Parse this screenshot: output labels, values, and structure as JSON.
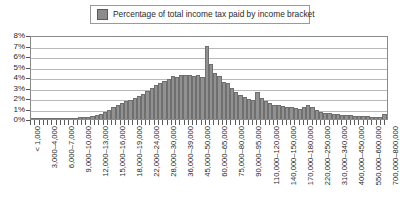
{
  "legend": {
    "label": "Percentage of total income tax paid by income bracket",
    "swatch_color": "#8c8c8c",
    "position": "top-center"
  },
  "chart_data": {
    "type": "bar",
    "title": "",
    "subtitle": "",
    "xlabel": "",
    "ylabel": "",
    "ylim": [
      0,
      8
    ],
    "ytick_labels": [
      "8%",
      "7%",
      "6%",
      "5%",
      "4%",
      "3%",
      "2%",
      "1%",
      "0%"
    ],
    "ytick_values": [
      8,
      7,
      6,
      5,
      4,
      3,
      2,
      1,
      0
    ],
    "grid": true,
    "bar_color": "#919191",
    "bar_edge_color": "#6f6f6f",
    "series": [
      {
        "name": "Percentage of total income tax paid by income bracket",
        "values": [
          0.05,
          0.05,
          0.05,
          0.06,
          0.07,
          0.08,
          0.09,
          0.1,
          0.1,
          0.12,
          0.13,
          0.15,
          0.17,
          0.2,
          0.25,
          0.35,
          0.5,
          0.7,
          0.9,
          1.1,
          1.3,
          1.5,
          1.7,
          1.85,
          2.0,
          2.2,
          2.4,
          2.7,
          3.0,
          3.2,
          3.4,
          3.6,
          3.8,
          4.1,
          4.0,
          4.2,
          4.15,
          4.2,
          4.1,
          4.15,
          4.0,
          7.0,
          5.2,
          4.4,
          4.1,
          3.5,
          3.4,
          3.0,
          2.6,
          2.3,
          2.1,
          1.9,
          1.8,
          2.6,
          2.0,
          1.7,
          1.5,
          1.35,
          1.3,
          1.25,
          1.15,
          1.1,
          1.05,
          1.0,
          1.15,
          1.3,
          1.1,
          0.85,
          0.7,
          0.6,
          0.55,
          0.5,
          0.45,
          0.4,
          0.38,
          0.35,
          0.33,
          0.3,
          0.28,
          0.25,
          0.22,
          0.2,
          0.18,
          0.5
        ]
      }
    ],
    "categories_labeled": [
      "< 1,000",
      "3,000–4,000",
      "6,000–7,000",
      "9,000–10,000",
      "12,000–13,000",
      "15,000–16,000",
      "18,000–19,000",
      "22,000–24,000",
      "28,000–30,000",
      "36,000–39,000",
      "45,000–50,000",
      "60,000–65,000",
      "75,000–80,000",
      "90,000–95,000",
      "110,000–120,000",
      "140,000–150,000",
      "170,000–180,000",
      "220,000–250,000",
      "310,000–340,000",
      "400,000–450,000",
      "550,000–600,000",
      "700,000–800,000"
    ],
    "label_every_n_bars": 4
  }
}
